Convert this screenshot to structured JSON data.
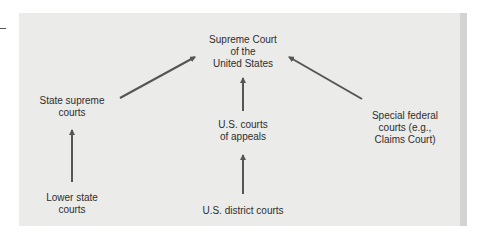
{
  "diagram": {
    "nodes": {
      "supreme_court": "Supreme Court\nof the\nUnited States",
      "state_supreme": "State supreme\ncourts",
      "courts_of_appeals": "U.S. courts\nof appeals",
      "special_federal": "Special federal\ncourts (e.g.,\nClaims Court)",
      "lower_state": "Lower state\ncourts",
      "district_courts": "U.S. district courts"
    },
    "edges": [
      {
        "from": "state_supreme",
        "to": "supreme_court"
      },
      {
        "from": "courts_of_appeals",
        "to": "supreme_court"
      },
      {
        "from": "special_federal",
        "to": "supreme_court"
      },
      {
        "from": "lower_state",
        "to": "state_supreme"
      },
      {
        "from": "district_courts",
        "to": "courts_of_appeals"
      }
    ],
    "colors": {
      "background": "#ebebea",
      "arrow": "#555555",
      "text": "#2e2e2e"
    }
  }
}
